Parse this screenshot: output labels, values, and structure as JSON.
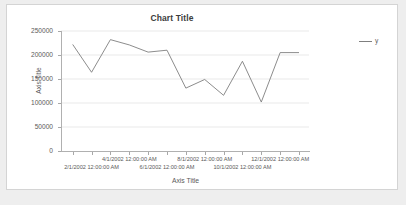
{
  "chart": {
    "title": "Chart Title",
    "x_axis_title": "Axis Title",
    "y_axis_title": "Axis Title"
  },
  "legend": {
    "position": "right",
    "entries": [
      {
        "label": "y",
        "color": "#7f7f7f",
        "marker": "line-swatch"
      }
    ]
  },
  "chart_data": {
    "type": "line",
    "title": "Chart Title",
    "xlabel": "Axis Title",
    "ylabel": "Axis Title",
    "grid": true,
    "legend_position": "right",
    "ylim": [
      0,
      250000
    ],
    "y_ticks": [
      0,
      50000,
      100000,
      150000,
      200000,
      250000
    ],
    "y_tick_labels": [
      "0",
      "50000",
      "100000",
      "150000",
      "200000",
      "250000"
    ],
    "x_tick_labels": [
      "2/1/2002 12:00:00 AM",
      "4/1/2002 12:00:00 AM",
      "6/1/2002 12:00:00 AM",
      "8/1/2002 12:00:00 AM",
      "10/1/2002 12:00:00 AM",
      "12/1/2002 12:00:00 AM"
    ],
    "x": [
      "1/1/2002 12:00:00 AM",
      "2/1/2002 12:00:00 AM",
      "3/1/2002 12:00:00 AM",
      "4/1/2002 12:00:00 AM",
      "5/1/2002 12:00:00 AM",
      "6/1/2002 12:00:00 AM",
      "7/1/2002 12:00:00 AM",
      "8/1/2002 12:00:00 AM",
      "9/1/2002 12:00:00 AM",
      "10/1/2002 12:00:00 AM",
      "11/1/2002 12:00:00 AM",
      "12/1/2002 12:00:00 AM",
      "1/1/2003 12:00:00 AM"
    ],
    "series": [
      {
        "name": "y",
        "color": "#7f7f7f",
        "values": [
          222000,
          164000,
          232000,
          221000,
          206000,
          210000,
          131000,
          149000,
          116000,
          187000,
          102000,
          205000,
          205000
        ]
      }
    ]
  }
}
